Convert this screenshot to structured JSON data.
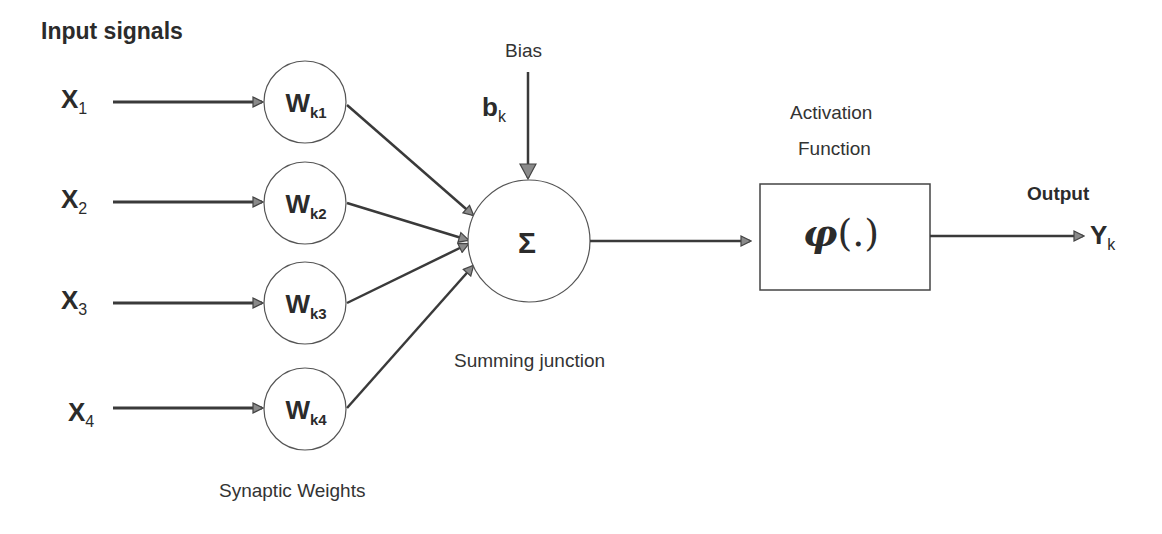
{
  "title": "Input signals",
  "inputs": [
    {
      "label": "X",
      "sub": "1"
    },
    {
      "label": "X",
      "sub": "2"
    },
    {
      "label": "X",
      "sub": "3"
    },
    {
      "label": "X",
      "sub": "4"
    }
  ],
  "weights": [
    {
      "label": "W",
      "sub": "k1"
    },
    {
      "label": "W",
      "sub": "k2"
    },
    {
      "label": "W",
      "sub": "k3"
    },
    {
      "label": "W",
      "sub": "k4"
    }
  ],
  "weights_caption": "Synaptic Weights",
  "bias": {
    "caption": "Bias",
    "label": "b",
    "sub": "k"
  },
  "summing": {
    "symbol": "Σ",
    "caption": "Summing junction"
  },
  "activation": {
    "caption_line1": "Activation",
    "caption_line2": "Function",
    "symbol": "φ",
    "args": "(.)"
  },
  "output": {
    "caption": "Output",
    "label": "Y",
    "sub": "k"
  },
  "colors": {
    "line": "#3a3a3a",
    "arrowhead": "#8a8a8a",
    "text": "#2b2b2b"
  }
}
